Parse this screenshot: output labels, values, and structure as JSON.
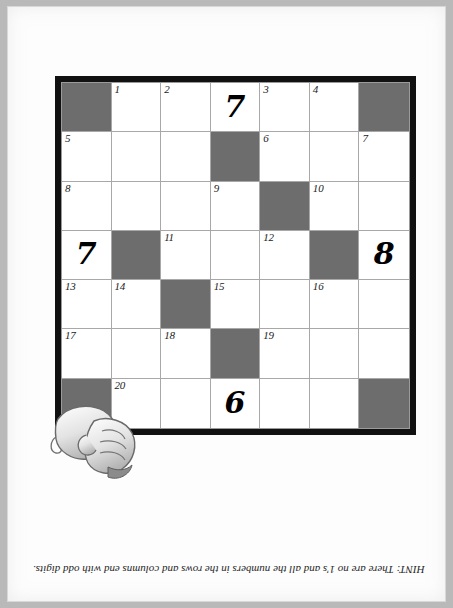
{
  "page": {
    "background_color": "#fdfdfd",
    "frame_color": "#b9b9b9"
  },
  "puzzle": {
    "type": "cross-number-puzzle",
    "rows": 7,
    "columns": 7,
    "shaded_color": "#6d6d6d",
    "grid_border_color": "#111111",
    "cell_line_color": "#a8a8a8",
    "cells": [
      [
        {
          "shaded": true,
          "clue": "",
          "big": ""
        },
        {
          "shaded": false,
          "clue": "1",
          "big": ""
        },
        {
          "shaded": false,
          "clue": "2",
          "big": ""
        },
        {
          "shaded": false,
          "clue": "",
          "big": "7"
        },
        {
          "shaded": false,
          "clue": "3",
          "big": ""
        },
        {
          "shaded": false,
          "clue": "4",
          "big": ""
        },
        {
          "shaded": true,
          "clue": "",
          "big": ""
        }
      ],
      [
        {
          "shaded": false,
          "clue": "5",
          "big": ""
        },
        {
          "shaded": false,
          "clue": "",
          "big": ""
        },
        {
          "shaded": false,
          "clue": "",
          "big": ""
        },
        {
          "shaded": true,
          "clue": "",
          "big": ""
        },
        {
          "shaded": false,
          "clue": "6",
          "big": ""
        },
        {
          "shaded": false,
          "clue": "",
          "big": ""
        },
        {
          "shaded": false,
          "clue": "7",
          "big": ""
        }
      ],
      [
        {
          "shaded": false,
          "clue": "8",
          "big": ""
        },
        {
          "shaded": false,
          "clue": "",
          "big": ""
        },
        {
          "shaded": false,
          "clue": "",
          "big": ""
        },
        {
          "shaded": false,
          "clue": "9",
          "big": ""
        },
        {
          "shaded": true,
          "clue": "",
          "big": ""
        },
        {
          "shaded": false,
          "clue": "10",
          "big": ""
        },
        {
          "shaded": false,
          "clue": "",
          "big": ""
        }
      ],
      [
        {
          "shaded": false,
          "clue": "",
          "big": "7"
        },
        {
          "shaded": true,
          "clue": "",
          "big": ""
        },
        {
          "shaded": false,
          "clue": "11",
          "big": ""
        },
        {
          "shaded": false,
          "clue": "",
          "big": ""
        },
        {
          "shaded": false,
          "clue": "12",
          "big": ""
        },
        {
          "shaded": true,
          "clue": "",
          "big": ""
        },
        {
          "shaded": false,
          "clue": "",
          "big": "8"
        }
      ],
      [
        {
          "shaded": false,
          "clue": "13",
          "big": ""
        },
        {
          "shaded": false,
          "clue": "14",
          "big": ""
        },
        {
          "shaded": true,
          "clue": "",
          "big": ""
        },
        {
          "shaded": false,
          "clue": "15",
          "big": ""
        },
        {
          "shaded": false,
          "clue": "",
          "big": ""
        },
        {
          "shaded": false,
          "clue": "16",
          "big": ""
        },
        {
          "shaded": false,
          "clue": "",
          "big": ""
        }
      ],
      [
        {
          "shaded": false,
          "clue": "17",
          "big": ""
        },
        {
          "shaded": false,
          "clue": "",
          "big": ""
        },
        {
          "shaded": false,
          "clue": "18",
          "big": ""
        },
        {
          "shaded": true,
          "clue": "",
          "big": ""
        },
        {
          "shaded": false,
          "clue": "19",
          "big": ""
        },
        {
          "shaded": false,
          "clue": "",
          "big": ""
        },
        {
          "shaded": false,
          "clue": "",
          "big": ""
        }
      ],
      [
        {
          "shaded": true,
          "clue": "",
          "big": ""
        },
        {
          "shaded": false,
          "clue": "20",
          "big": ""
        },
        {
          "shaded": false,
          "clue": "",
          "big": ""
        },
        {
          "shaded": false,
          "clue": "",
          "big": "6"
        },
        {
          "shaded": false,
          "clue": "",
          "big": ""
        },
        {
          "shaded": false,
          "clue": "",
          "big": ""
        },
        {
          "shaded": true,
          "clue": "",
          "big": ""
        }
      ]
    ]
  },
  "hint": {
    "text": "HINT: There are no 1's and all the numbers in the rows and columns end with odd digits.",
    "orientation": "upside-down"
  },
  "illustration": {
    "name": "cartoon-hand-fist",
    "description": "pointing cartoon hand overlapping lower-left corner of grid"
  }
}
